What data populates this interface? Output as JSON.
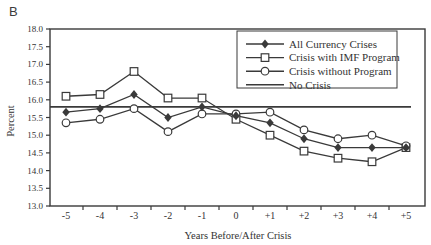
{
  "panel_label": "B",
  "colors": {
    "ink": "#3a3a3a",
    "background": "#ffffff"
  },
  "chart_data": {
    "type": "line",
    "title": "",
    "xlabel": "Years Before/After Crisis",
    "ylabel": "Percent",
    "x_tick_labels": [
      "-5",
      "-4",
      "-3",
      "-2",
      "-1",
      "0",
      "+1",
      "+2",
      "+3",
      "+4",
      "+5"
    ],
    "y_tick_labels": [
      "18.0",
      "17.5",
      "17.0",
      "16.5",
      "16.0",
      "15.5",
      "15.0",
      "14.5",
      "14.0",
      "13.5",
      "13.0"
    ],
    "ylim": [
      13.0,
      18.0
    ],
    "grid": false,
    "legend_position": "upper-right",
    "series": [
      {
        "name": "All Currency Crises",
        "marker": "filled-diamond",
        "values": [
          15.65,
          15.75,
          16.15,
          15.5,
          15.8,
          15.55,
          15.35,
          14.9,
          14.65,
          14.65,
          14.65
        ]
      },
      {
        "name": "Crisis with IMF Program",
        "marker": "open-square",
        "values": [
          16.1,
          16.15,
          16.8,
          16.05,
          16.05,
          15.45,
          15.0,
          14.55,
          14.35,
          14.25,
          14.65
        ]
      },
      {
        "name": "Crisis without Program",
        "marker": "open-circle",
        "values": [
          15.35,
          15.45,
          15.75,
          15.1,
          15.6,
          15.6,
          15.65,
          15.15,
          14.9,
          15.0,
          14.7
        ]
      },
      {
        "name": "No Crisis",
        "marker": "none",
        "values": [
          15.8,
          15.8,
          15.8,
          15.8,
          15.8,
          15.8,
          15.8,
          15.8,
          15.8,
          15.8,
          15.8
        ]
      }
    ]
  }
}
